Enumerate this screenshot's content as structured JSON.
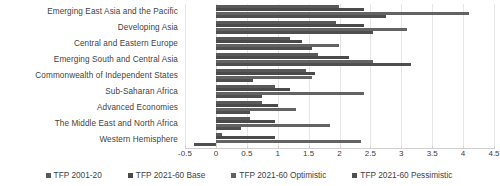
{
  "chart_data": {
    "type": "bar",
    "orientation": "horizontal",
    "title": "",
    "xlabel": "",
    "ylabel": "",
    "xlim": [
      -0.5,
      4.5
    ],
    "xticks": [
      -0.5,
      0,
      0.5,
      1,
      1.5,
      2,
      2.5,
      3,
      3.5,
      4,
      4.5
    ],
    "xtick_labels": [
      "-0.5",
      "0",
      "0.5",
      "1",
      "1.5",
      "2",
      "2.5",
      "3",
      "3.5",
      "4",
      "4.5"
    ],
    "grid": true,
    "legend_position": "bottom",
    "categories": [
      "Emerging East Asia and the Pacific",
      "Developing Asia",
      "Central and Eastern Europe",
      "Emerging South and Central Asia",
      "Commonwealth of Independent States",
      "Sub-Saharan Africa",
      "Advanced Economies",
      "The Middle East and North Africa",
      "Western Hemisphere"
    ],
    "series": [
      {
        "name": "TFP 2001-20",
        "color": "#595959",
        "values": [
          2.0,
          1.95,
          1.2,
          1.65,
          1.45,
          0.95,
          0.75,
          0.55,
          0.1
        ]
      },
      {
        "name": "TFP 2021-60 Base",
        "color": "#4a4a4a",
        "values": [
          2.4,
          2.4,
          1.4,
          2.15,
          1.6,
          1.2,
          1.0,
          0.95,
          0.95
        ]
      },
      {
        "name": "TFP 2021-60 Optimistic",
        "color": "#636363",
        "values": [
          4.1,
          3.1,
          2.0,
          2.55,
          1.55,
          2.4,
          1.3,
          1.85,
          2.35
        ]
      },
      {
        "name": "TFP 2021-60 Pessimistic",
        "color": "#4f4f4f",
        "values": [
          2.75,
          2.55,
          1.55,
          3.15,
          0.6,
          0.75,
          0.55,
          0.4,
          -0.35
        ]
      }
    ]
  },
  "legend": {
    "items": [
      {
        "label": "TFP 2001-20",
        "color": "#595959"
      },
      {
        "label": "TFP 2021-60 Base",
        "color": "#4a4a4a"
      },
      {
        "label": "TFP 2021-60 Optimistic",
        "color": "#636363"
      },
      {
        "label": "TFP 2021-60 Pessimistic",
        "color": "#4f4f4f"
      }
    ]
  }
}
